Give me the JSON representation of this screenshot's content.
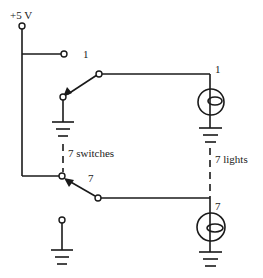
{
  "diagram": {
    "type": "circuit-schematic",
    "supply_label": "+5 V",
    "switches": [
      {
        "label": "1",
        "position": "ground"
      },
      {
        "label": "7",
        "position": "supply"
      }
    ],
    "lights": [
      {
        "label": "1"
      },
      {
        "label": "7"
      }
    ],
    "switches_group_label": "7 switches",
    "lights_group_label": "7 lights"
  },
  "colors": {
    "ink": "#1a1a1a",
    "background": "#ffffff"
  }
}
